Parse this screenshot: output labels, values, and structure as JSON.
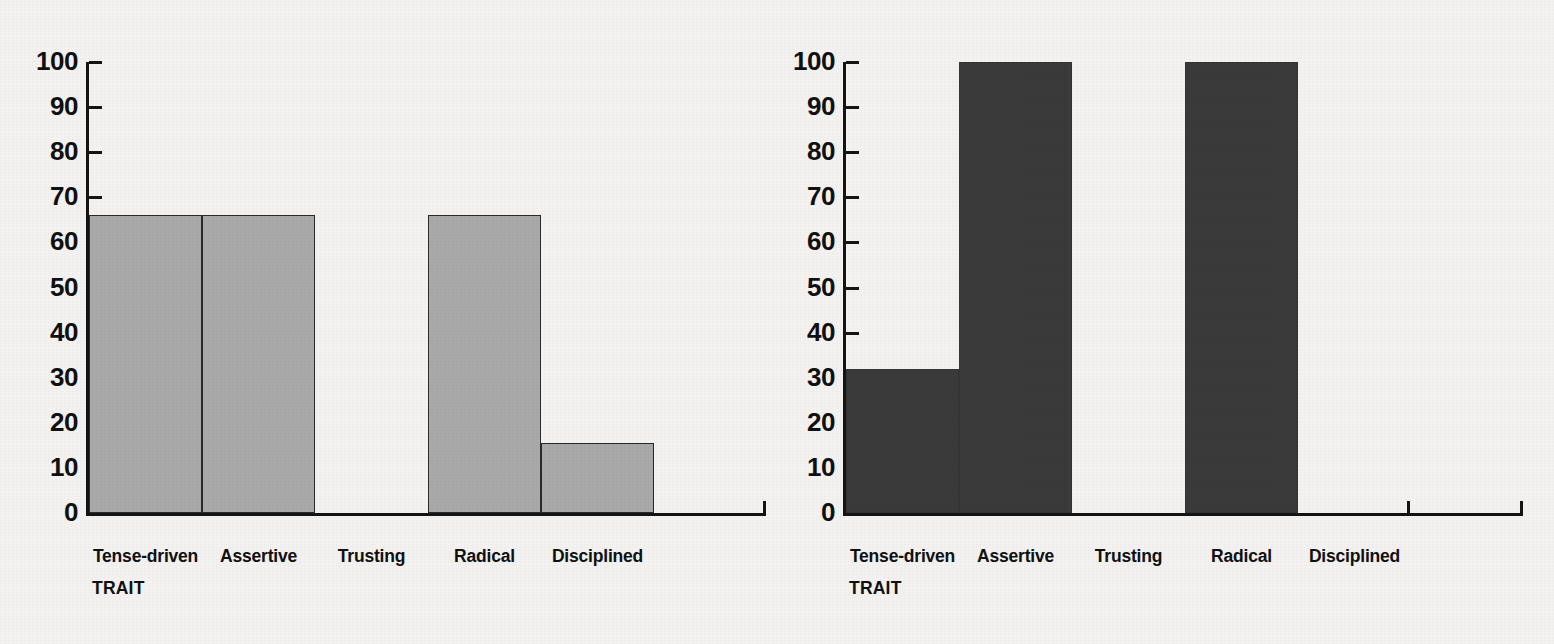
{
  "figure": {
    "background_color": "#f3f2f0",
    "panel_count": 2
  },
  "chart_data": [
    {
      "type": "bar",
      "panel": "left",
      "title": "",
      "xlabel": "TRAIT",
      "ylabel": "",
      "categories": [
        "Tense-driven",
        "Assertive",
        "Trusting",
        "Radical",
        "Disciplined"
      ],
      "values": [
        66,
        66,
        0,
        66,
        15.5
      ],
      "ylim": [
        0,
        100
      ],
      "yticks": [
        0,
        10,
        20,
        30,
        40,
        50,
        60,
        70,
        80,
        90,
        100
      ],
      "ytick_labels": [
        "0",
        "10",
        "20",
        "30",
        "40",
        "50",
        "60",
        "70",
        "80",
        "90",
        "100"
      ],
      "bar_color": "#a9a9a9",
      "bar_edge_color": "#2a2a2a",
      "grid": false,
      "legend": false
    },
    {
      "type": "bar",
      "panel": "right",
      "title": "",
      "xlabel": "TRAIT",
      "ylabel": "",
      "categories": [
        "Tense-driven",
        "Assertive",
        "Trusting",
        "Radical",
        "Disciplined"
      ],
      "values": [
        32,
        100,
        0,
        100,
        0
      ],
      "ylim": [
        0,
        100
      ],
      "yticks": [
        0,
        10,
        20,
        30,
        40,
        50,
        60,
        70,
        80,
        90,
        100
      ],
      "ytick_labels": [
        "0",
        "10",
        "20",
        "30",
        "40",
        "50",
        "60",
        "70",
        "80",
        "90",
        "100"
      ],
      "bar_color": "#3a3a3a",
      "bar_edge_color": "#343434",
      "grid": false,
      "legend": false
    }
  ]
}
